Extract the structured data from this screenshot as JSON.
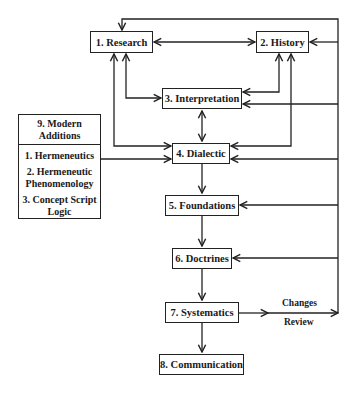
{
  "diagram": {
    "nodes": [
      {
        "id": "research",
        "label": "1. Research"
      },
      {
        "id": "history",
        "label": "2. History"
      },
      {
        "id": "interpretation",
        "label": "3. Interpretation"
      },
      {
        "id": "dialectic",
        "label": "4. Dialectic"
      },
      {
        "id": "foundations",
        "label": "5. Foundations"
      },
      {
        "id": "doctrines",
        "label": "6. Doctrines"
      },
      {
        "id": "systematics",
        "label": "7. Systematics"
      },
      {
        "id": "communication",
        "label": "8. Communication"
      }
    ],
    "modern_additions": {
      "title_line1": "9. Modern",
      "title_line2": "Additions",
      "items": [
        {
          "line1": "1. Hermeneutics",
          "line2": ""
        },
        {
          "line1": "2. Hermeneutic",
          "line2": "Phenomenology"
        },
        {
          "line1": "3. Concept Script",
          "line2": "Logic"
        }
      ]
    },
    "edge_labels": {
      "changes": "Changes",
      "review": "Review"
    },
    "colors": {
      "line": "#222222",
      "background": "#ffffff"
    }
  }
}
